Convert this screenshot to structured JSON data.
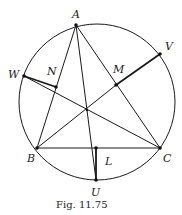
{
  "figure": {
    "caption": "Fig. 11.75",
    "circle": {
      "cx": 97,
      "cy": 102,
      "r": 78
    },
    "points": {
      "A": {
        "label": "A",
        "x": 76,
        "y": 25
      },
      "B": {
        "label": "B",
        "x": 37,
        "y": 148
      },
      "C": {
        "label": "C",
        "x": 160,
        "y": 148
      },
      "V": {
        "label": "V",
        "x": 160,
        "y": 54
      },
      "W": {
        "label": "W",
        "x": 24,
        "y": 76
      },
      "U": {
        "label": "U",
        "x": 96,
        "y": 180
      },
      "M": {
        "label": "M",
        "x": 116,
        "y": 85
      },
      "N": {
        "label": "N",
        "x": 56,
        "y": 87
      },
      "L": {
        "label": "L",
        "x": 96,
        "y": 148
      },
      "H": {
        "x": 87,
        "y": 110
      }
    }
  }
}
